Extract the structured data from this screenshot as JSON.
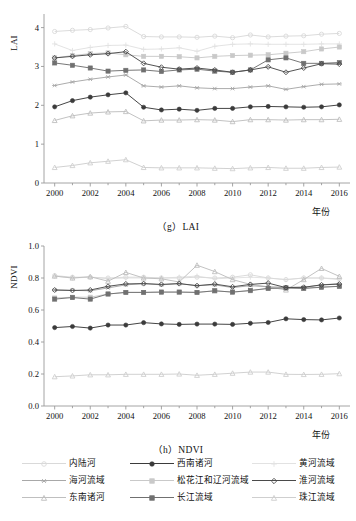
{
  "figure": {
    "panels": [
      {
        "id": "lai",
        "caption": "（g）LAI",
        "ylabel": "LAI",
        "xlabel": "年份"
      },
      {
        "id": "ndvi",
        "caption": "（h）NDVI",
        "ylabel": "NDVI",
        "xlabel": "年份"
      }
    ]
  },
  "legend": {
    "items": [
      {
        "label": "内陆河",
        "color": "#d9d9d9",
        "marker": "circle-open",
        "row": 1,
        "col": 1
      },
      {
        "label": "西南诸河",
        "color": "#3b3b3b",
        "marker": "circle-fill",
        "row": 1,
        "col": 2
      },
      {
        "label": "黄河流域",
        "color": "#e2e2e2",
        "marker": "plus",
        "row": 1,
        "col": 3
      },
      {
        "label": "海河流域",
        "color": "#a8a8a8",
        "marker": "asterisk",
        "row": 2,
        "col": 1
      },
      {
        "label": "松花江和辽河流域",
        "color": "#c9c9c9",
        "marker": "square-fill",
        "row": 2,
        "col": 2
      },
      {
        "label": "淮河流域",
        "color": "#4a4a4a",
        "marker": "diamond-open",
        "row": 2,
        "col": 3
      },
      {
        "label": "东南诸河",
        "color": "#bfbfbf",
        "marker": "triangle-up",
        "row": 3,
        "col": 1
      },
      {
        "label": "长江流域",
        "color": "#707070",
        "marker": "square-fill",
        "row": 3,
        "col": 2
      },
      {
        "label": "珠江流域",
        "color": "#cfcfcf",
        "marker": "triangle-up",
        "row": 3,
        "col": 3
      }
    ]
  },
  "chart_data": [
    {
      "type": "line",
      "id": "lai",
      "title": "（g）LAI",
      "xlabel": "年份",
      "ylabel": "LAI",
      "grid": false,
      "legend_position": "below-figure",
      "x": [
        2000,
        2001,
        2002,
        2003,
        2004,
        2005,
        2006,
        2007,
        2008,
        2009,
        2010,
        2011,
        2012,
        2013,
        2014,
        2015,
        2016
      ],
      "xlim": [
        1999.4,
        2016.6
      ],
      "ylim": [
        0,
        4.35
      ],
      "xticks": [
        2000,
        2002,
        2004,
        2006,
        2008,
        2010,
        2012,
        2014,
        2016
      ],
      "yticks": [
        0,
        1,
        2,
        3,
        4
      ],
      "series": [
        {
          "name": "内陆河",
          "color": "#d9d9d9",
          "marker": "circle-open",
          "values": [
            3.9,
            3.93,
            3.95,
            3.99,
            4.03,
            3.77,
            3.76,
            3.76,
            3.75,
            3.78,
            3.74,
            3.81,
            3.76,
            3.78,
            3.79,
            3.83,
            3.85
          ]
        },
        {
          "name": "西南诸河",
          "color": "#3b3b3b",
          "marker": "circle-fill",
          "values": [
            1.96,
            2.12,
            2.21,
            2.27,
            2.32,
            1.95,
            1.88,
            1.9,
            1.87,
            1.92,
            1.92,
            1.96,
            1.97,
            1.96,
            1.95,
            1.96,
            2.01
          ]
        },
        {
          "name": "黄河流域",
          "color": "#e2e2e2",
          "marker": "plus",
          "values": [
            3.58,
            3.41,
            3.49,
            3.54,
            3.55,
            3.44,
            3.45,
            3.48,
            3.39,
            3.52,
            3.57,
            3.58,
            3.57,
            3.57,
            3.57,
            3.58,
            3.58
          ]
        },
        {
          "name": "海河流域",
          "color": "#a8a8a8",
          "marker": "asterisk",
          "values": [
            2.51,
            2.6,
            2.67,
            2.73,
            2.78,
            2.5,
            2.47,
            2.5,
            2.45,
            2.43,
            2.43,
            2.47,
            2.5,
            2.41,
            2.48,
            2.54,
            2.55
          ]
        },
        {
          "name": "松花江和辽河流域",
          "color": "#c9c9c9",
          "marker": "square-fill",
          "values": [
            3.22,
            3.28,
            3.33,
            3.35,
            3.3,
            3.26,
            3.26,
            3.25,
            3.22,
            3.26,
            3.28,
            3.29,
            3.3,
            3.34,
            3.38,
            3.45,
            3.5
          ]
        },
        {
          "name": "淮河流域",
          "color": "#4a4a4a",
          "marker": "diamond-open",
          "values": [
            3.22,
            3.26,
            3.3,
            3.33,
            3.38,
            3.08,
            2.98,
            2.93,
            2.96,
            2.91,
            2.85,
            2.91,
            2.99,
            2.85,
            2.96,
            3.07,
            3.06
          ]
        },
        {
          "name": "东南诸河",
          "color": "#bfbfbf",
          "marker": "triangle-up",
          "values": [
            1.61,
            1.73,
            1.8,
            1.83,
            1.84,
            1.6,
            1.62,
            1.62,
            1.63,
            1.62,
            1.58,
            1.63,
            1.63,
            1.62,
            1.63,
            1.63,
            1.64
          ]
        },
        {
          "name": "长江流域",
          "color": "#707070",
          "marker": "square-fill",
          "values": [
            3.09,
            3.03,
            2.96,
            2.88,
            2.9,
            2.91,
            2.87,
            2.91,
            2.93,
            2.88,
            2.85,
            2.91,
            3.17,
            3.22,
            3.08,
            3.08,
            3.1
          ]
        },
        {
          "name": "珠江流域",
          "color": "#cfcfcf",
          "marker": "triangle-up",
          "values": [
            0.4,
            0.45,
            0.52,
            0.56,
            0.6,
            0.4,
            0.39,
            0.39,
            0.39,
            0.38,
            0.37,
            0.39,
            0.4,
            0.38,
            0.38,
            0.4,
            0.41
          ]
        }
      ]
    },
    {
      "type": "line",
      "id": "ndvi",
      "title": "（h）NDVI",
      "xlabel": "年份",
      "ylabel": "NDVI",
      "grid": false,
      "legend_position": "below-figure",
      "x": [
        2000,
        2001,
        2002,
        2003,
        2004,
        2005,
        2006,
        2007,
        2008,
        2009,
        2010,
        2011,
        2012,
        2013,
        2014,
        2015,
        2016
      ],
      "xlim": [
        1999.4,
        2016.6
      ],
      "ylim": [
        0.0,
        1.0
      ],
      "xticks": [
        2000,
        2002,
        2004,
        2006,
        2008,
        2010,
        2012,
        2014,
        2016
      ],
      "yticks": [
        0.0,
        0.2,
        0.4,
        0.6,
        0.8,
        1.0
      ],
      "ytick_labels": [
        "0.0",
        "0.2",
        "0.4",
        "0.6",
        "0.8",
        "1.0"
      ],
      "series": [
        {
          "name": "内陆河",
          "color": "#d9d9d9",
          "marker": "circle-open",
          "values": [
            0.815,
            0.805,
            0.805,
            0.8,
            0.805,
            0.805,
            0.8,
            0.8,
            0.805,
            0.8,
            0.805,
            0.82,
            0.8,
            0.79,
            0.8,
            0.8,
            0.795
          ]
        },
        {
          "name": "西南诸河",
          "color": "#3b3b3b",
          "marker": "circle-fill",
          "values": [
            0.49,
            0.497,
            0.487,
            0.506,
            0.506,
            0.521,
            0.513,
            0.51,
            0.512,
            0.512,
            0.51,
            0.517,
            0.522,
            0.545,
            0.54,
            0.538,
            0.55
          ]
        },
        {
          "name": "黄河流域",
          "color": "#e2e2e2",
          "marker": "plus",
          "values": [
            0.812,
            0.8,
            0.805,
            0.795,
            0.8,
            0.8,
            0.8,
            0.805,
            0.812,
            0.795,
            0.8,
            0.805,
            0.8,
            0.79,
            0.8,
            0.8,
            0.79
          ]
        },
        {
          "name": "海河流域",
          "color": "#a8a8a8",
          "marker": "asterisk",
          "values": [
            0.725,
            0.723,
            0.72,
            0.738,
            0.757,
            0.765,
            0.757,
            0.765,
            0.752,
            0.757,
            0.74,
            0.752,
            0.745,
            0.742,
            0.742,
            0.757,
            0.765
          ]
        },
        {
          "name": "松花江和辽河流域",
          "color": "#c9c9c9",
          "marker": "square-fill",
          "values": [
            0.675,
            0.68,
            0.68,
            0.7,
            0.71,
            0.71,
            0.712,
            0.712,
            0.71,
            0.72,
            0.712,
            0.72,
            0.735,
            0.738,
            0.735,
            0.745,
            0.748
          ]
        },
        {
          "name": "淮河流域",
          "color": "#4a4a4a",
          "marker": "diamond-open",
          "values": [
            0.725,
            0.722,
            0.725,
            0.748,
            0.763,
            0.765,
            0.76,
            0.765,
            0.752,
            0.762,
            0.745,
            0.76,
            0.768,
            0.74,
            0.742,
            0.757,
            0.762
          ]
        },
        {
          "name": "东南诸河",
          "color": "#bfbfbf",
          "marker": "triangle-up",
          "values": [
            0.812,
            0.8,
            0.808,
            0.78,
            0.835,
            0.8,
            0.795,
            0.775,
            0.88,
            0.84,
            0.79,
            0.76,
            0.745,
            0.725,
            0.79,
            0.86,
            0.81
          ]
        },
        {
          "name": "长江流域",
          "color": "#707070",
          "marker": "square-fill",
          "values": [
            0.668,
            0.678,
            0.668,
            0.7,
            0.71,
            0.71,
            0.712,
            0.712,
            0.71,
            0.72,
            0.712,
            0.722,
            0.735,
            0.738,
            0.735,
            0.742,
            0.748
          ]
        },
        {
          "name": "珠江流域",
          "color": "#cfcfcf",
          "marker": "triangle-up",
          "values": [
            0.183,
            0.188,
            0.195,
            0.195,
            0.198,
            0.198,
            0.198,
            0.2,
            0.192,
            0.198,
            0.205,
            0.212,
            0.212,
            0.198,
            0.197,
            0.198,
            0.202
          ]
        }
      ]
    }
  ]
}
